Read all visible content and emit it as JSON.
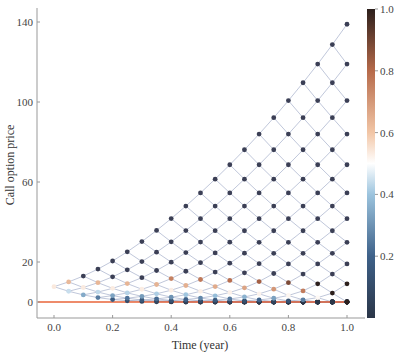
{
  "chart_data": {
    "type": "scatter",
    "subtype": "binomial-tree-lattice",
    "title": "",
    "xlabel": "Time (year)",
    "ylabel": "Call option price",
    "xlim": [
      -0.06,
      1.06
    ],
    "ylim": [
      -9,
      143
    ],
    "x_ticks": [
      0.0,
      0.2,
      0.4,
      0.6,
      0.8,
      1.0
    ],
    "x_tick_labels": [
      "0.0",
      "0.2",
      "0.4",
      "0.6",
      "0.8",
      "1.0"
    ],
    "y_ticks": [
      0,
      20,
      60,
      100,
      140
    ],
    "y_tick_labels": [
      "0",
      "20",
      "60",
      "100",
      "140"
    ],
    "grid": false,
    "model": {
      "steps": 20,
      "T": 1.0,
      "dt": 0.05,
      "S0": 100,
      "K": 100,
      "u": 1.0445,
      "r": 0.0,
      "initial_price_approx": 4,
      "max_terminal_price_approx": 139
    },
    "reference_line": {
      "y": 0,
      "color": "#e8643a",
      "label": ""
    },
    "colorbar": {
      "min": 0.0,
      "max": 1.0,
      "ticks": [
        0.2,
        0.4,
        0.6,
        0.8,
        1.0
      ],
      "tick_labels": [
        "0.2",
        "0.4",
        "0.6",
        "0.8",
        "1.0"
      ],
      "colormap": [
        {
          "v": 0.0,
          "color": "#2b3648"
        },
        {
          "v": 0.2,
          "color": "#3e6189"
        },
        {
          "v": 0.4,
          "color": "#9cc4de"
        },
        {
          "v": 0.5,
          "color": "#ffffff"
        },
        {
          "v": 0.6,
          "color": "#f2c6a6"
        },
        {
          "v": 0.8,
          "color": "#b66a4a"
        },
        {
          "v": 1.0,
          "color": "#2c1f1c"
        }
      ]
    },
    "node_color": "#3b3f55",
    "edge_color": "#8d9bbd"
  },
  "labels": {
    "xlabel": "Time (year)",
    "ylabel": "Call option price"
  }
}
